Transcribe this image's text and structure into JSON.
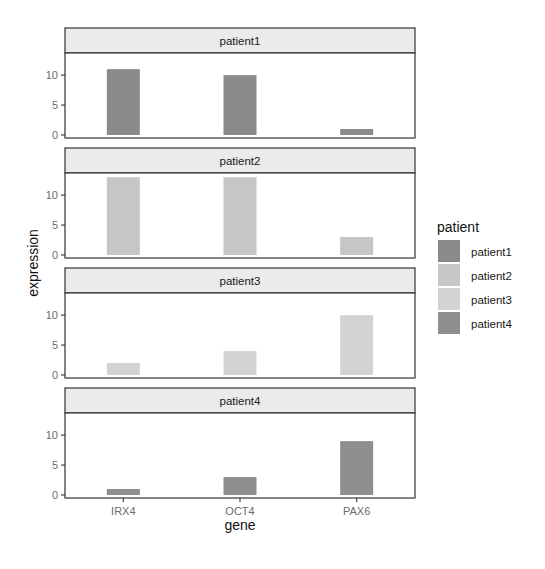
{
  "chart_data": {
    "type": "bar",
    "facet_by": "patient",
    "categories": [
      "IRX4",
      "OCT4",
      "PAX6"
    ],
    "series": [
      {
        "name": "patient1",
        "color": "#8a8a8a",
        "values": [
          11,
          10,
          1
        ]
      },
      {
        "name": "patient2",
        "color": "#c6c6c6",
        "values": [
          13,
          13,
          3
        ]
      },
      {
        "name": "patient3",
        "color": "#d3d3d3",
        "values": [
          2,
          4,
          10
        ]
      },
      {
        "name": "patient4",
        "color": "#8e8e8e",
        "values": [
          1,
          3,
          9
        ]
      }
    ],
    "title": "",
    "xlabel": "gene",
    "ylabel": "expression",
    "ylim": [
      0,
      13.7
    ],
    "yticks": [
      0,
      5,
      10
    ],
    "grid": false,
    "legend": {
      "title": "patient",
      "position": "right"
    }
  }
}
